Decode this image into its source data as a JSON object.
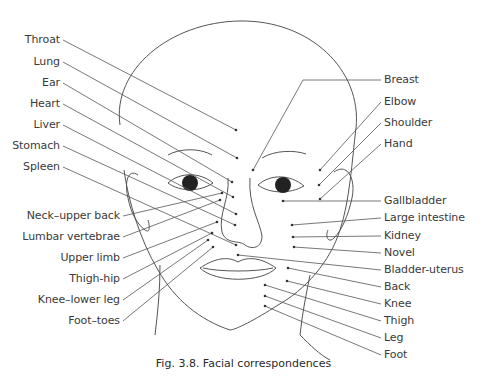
{
  "figure": {
    "caption": "Fig. 3.8. Facial correspondences"
  },
  "labels_left": [
    {
      "text": "Throat",
      "x": 60,
      "y": 40,
      "tx": 236,
      "ty": 130
    },
    {
      "text": "Lung",
      "x": 60,
      "y": 62,
      "tx": 237,
      "ty": 158
    },
    {
      "text": "Ear",
      "x": 60,
      "y": 83,
      "tx": 232,
      "ty": 182
    },
    {
      "text": "Heart",
      "x": 60,
      "y": 104,
      "tx": 233,
      "ty": 197
    },
    {
      "text": "Liver",
      "x": 60,
      "y": 125,
      "tx": 236,
      "ty": 214
    },
    {
      "text": "Stomach",
      "x": 60,
      "y": 146,
      "tx": 235,
      "ty": 225
    },
    {
      "text": "Spleen",
      "x": 60,
      "y": 167,
      "tx": 236,
      "ty": 245
    },
    {
      "text": "Neck–upper back",
      "x": 120,
      "y": 216,
      "tx": 222,
      "ty": 193
    },
    {
      "text": "Lumbar vertebrae",
      "x": 120,
      "y": 237,
      "tx": 220,
      "ty": 200
    },
    {
      "text": "Upper limb",
      "x": 120,
      "y": 258,
      "tx": 217,
      "ty": 222
    },
    {
      "text": "Thigh-hip",
      "x": 120,
      "y": 279,
      "tx": 212,
      "ty": 233
    },
    {
      "text": "Knee–lower leg",
      "x": 120,
      "y": 300,
      "tx": 208,
      "ty": 240
    },
    {
      "text": "Foot–toes",
      "x": 120,
      "y": 321,
      "tx": 213,
      "ty": 247
    }
  ],
  "labels_right": [
    {
      "text": "Breast",
      "x": 384,
      "y": 80,
      "tx": 253,
      "ty": 170
    },
    {
      "text": "Elbow",
      "x": 384,
      "y": 102,
      "tx": 320,
      "ty": 170
    },
    {
      "text": "Shoulder",
      "x": 384,
      "y": 123,
      "tx": 319,
      "ty": 185
    },
    {
      "text": "Hand",
      "x": 384,
      "y": 144,
      "tx": 320,
      "ty": 199
    },
    {
      "text": "Gallbladder",
      "x": 384,
      "y": 201,
      "tx": 283,
      "ty": 201
    },
    {
      "text": "Large intestine",
      "x": 384,
      "y": 218,
      "tx": 292,
      "ty": 225
    },
    {
      "text": "Kidney",
      "x": 384,
      "y": 236,
      "tx": 293,
      "ty": 237
    },
    {
      "text": "Novel",
      "x": 384,
      "y": 253,
      "tx": 294,
      "ty": 247
    },
    {
      "text": "Bladder-uterus",
      "x": 384,
      "y": 270,
      "tx": 238,
      "ty": 255
    },
    {
      "text": "Back",
      "x": 384,
      "y": 287,
      "tx": 288,
      "ty": 268
    },
    {
      "text": "Knee",
      "x": 384,
      "y": 304,
      "tx": 287,
      "ty": 281
    },
    {
      "text": "Thigh",
      "x": 384,
      "y": 321,
      "tx": 265,
      "ty": 285
    },
    {
      "text": "Leg",
      "x": 384,
      "y": 338,
      "tx": 265,
      "ty": 296
    },
    {
      "text": "Foot",
      "x": 384,
      "y": 355,
      "tx": 265,
      "ty": 306
    }
  ]
}
